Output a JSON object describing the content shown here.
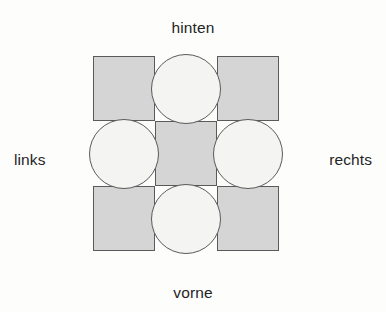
{
  "diagram": {
    "title_text": "",
    "colors": {
      "background": "#fdfdfc",
      "square_fill": "#d5d5d5",
      "circle_fill": "#f4f4f3",
      "stroke": "#5a5a5a",
      "text": "#242424"
    },
    "labels": {
      "top": "hinten",
      "left": "links",
      "right": "rechts",
      "bottom": "vorne"
    },
    "grid": {
      "rows": 3,
      "cols": 3,
      "cells": [
        {
          "row": 0,
          "col": 0,
          "shape": "square",
          "name": "cell-back-left"
        },
        {
          "row": 0,
          "col": 1,
          "shape": "circle",
          "name": "cell-back-center"
        },
        {
          "row": 0,
          "col": 2,
          "shape": "square",
          "name": "cell-back-right"
        },
        {
          "row": 1,
          "col": 0,
          "shape": "circle",
          "name": "cell-middle-left"
        },
        {
          "row": 1,
          "col": 1,
          "shape": "square",
          "name": "cell-middle-center"
        },
        {
          "row": 1,
          "col": 2,
          "shape": "circle",
          "name": "cell-middle-right"
        },
        {
          "row": 2,
          "col": 0,
          "shape": "square",
          "name": "cell-front-left"
        },
        {
          "row": 2,
          "col": 1,
          "shape": "circle",
          "name": "cell-front-center"
        },
        {
          "row": 2,
          "col": 2,
          "shape": "square",
          "name": "cell-front-right"
        }
      ]
    }
  }
}
